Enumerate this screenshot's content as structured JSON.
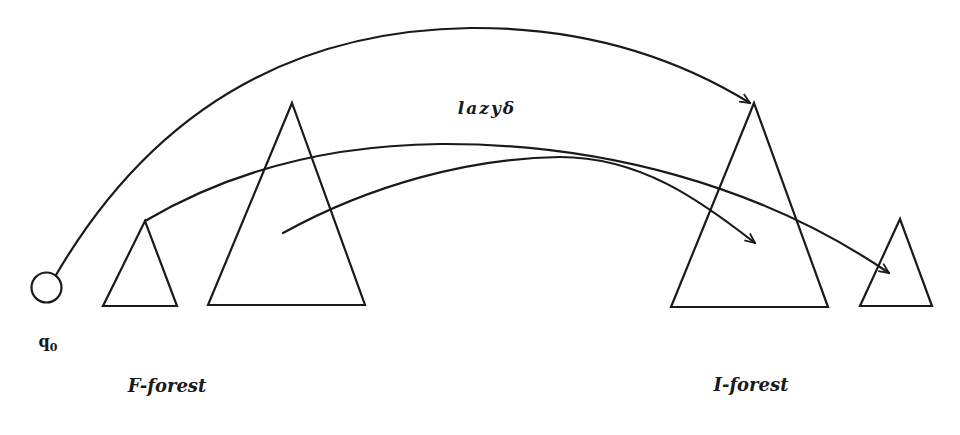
{
  "diagram": {
    "type": "forest-transition-diagram",
    "labels": {
      "edge_label": "lazyδ",
      "state_label": "q",
      "state_subscript": "0",
      "left_group": "F-forest",
      "right_group": "I-forest"
    },
    "nodes": [
      {
        "id": "q0",
        "shape": "circle",
        "label": "q0"
      },
      {
        "id": "f1",
        "shape": "triangle",
        "group": "F-forest",
        "size": "small"
      },
      {
        "id": "f2",
        "shape": "triangle",
        "group": "F-forest",
        "size": "large"
      },
      {
        "id": "i1",
        "shape": "triangle",
        "group": "I-forest",
        "size": "large"
      },
      {
        "id": "i2",
        "shape": "triangle",
        "group": "I-forest",
        "size": "small"
      }
    ],
    "edges": [
      {
        "from": "q0",
        "to": "i1 (root)",
        "label": "lazyδ"
      },
      {
        "from": "f1 (root)",
        "to": "i2 (inside)",
        "label": ""
      },
      {
        "from": "f2 (inside)",
        "to": "i1 (inside)",
        "label": ""
      }
    ],
    "colors": {
      "ink": "#1a1a1a",
      "background": "#ffffff"
    }
  }
}
